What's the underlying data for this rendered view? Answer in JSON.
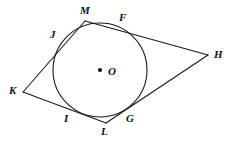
{
  "figure": {
    "width": 235,
    "height": 145,
    "background_color": "#ffffff",
    "stroke_color": "#1a1a1a",
    "stroke_width": 1.1,
    "label_color": "#111111"
  },
  "circle": {
    "center_label": "O",
    "center_x": 100,
    "center_y": 70,
    "radius": 47,
    "center_dot_radius": 2.1,
    "center_label_x": 108,
    "center_label_y": 66
  },
  "vertices": [
    {
      "id": "M",
      "label": "M",
      "x": 85,
      "y": 21,
      "label_x": 80,
      "label_y": 5
    },
    {
      "id": "H",
      "label": "H",
      "x": 208,
      "y": 55,
      "label_x": 214,
      "label_y": 49
    },
    {
      "id": "L",
      "label": "L",
      "x": 106,
      "y": 123,
      "label_x": 101,
      "label_y": 126
    },
    {
      "id": "K",
      "label": "K",
      "x": 23,
      "y": 92,
      "label_x": 9,
      "label_y": 85
    }
  ],
  "tangent_points": [
    {
      "id": "J",
      "label": "J",
      "x": 59,
      "y": 44,
      "label_x": 50,
      "label_y": 29,
      "on_segment": "K-M"
    },
    {
      "id": "F",
      "label": "F",
      "x": 124,
      "y": 27,
      "label_x": 119,
      "label_y": 12,
      "on_segment": "M-H"
    },
    {
      "id": "G",
      "label": "G",
      "x": 134,
      "y": 110,
      "label_x": 126,
      "label_y": 113,
      "on_segment": "H-L"
    },
    {
      "id": "I",
      "label": "I",
      "x": 67,
      "y": 111,
      "label_x": 64,
      "label_y": 113,
      "on_segment": "L-K"
    }
  ],
  "edges": [
    {
      "id": "K-M",
      "from": "K",
      "to": "M"
    },
    {
      "id": "M-H",
      "from": "M",
      "to": "H"
    },
    {
      "id": "H-L",
      "from": "H",
      "to": "L"
    },
    {
      "id": "L-K",
      "from": "L",
      "to": "K"
    }
  ]
}
